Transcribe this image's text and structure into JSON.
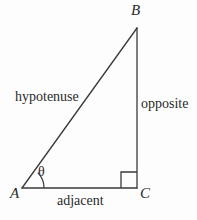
{
  "figure": {
    "type": "right-triangle-trigonometry-diagram",
    "background_color": "#fdfdfd",
    "stroke_color": "#3a3a3a",
    "text_color": "#2a2a2a",
    "vertices": {
      "A": {
        "label": "A",
        "x": 22,
        "y": 188
      },
      "B": {
        "label": "B",
        "x": 137,
        "y": 28
      },
      "C": {
        "label": "C",
        "x": 137,
        "y": 188
      }
    },
    "sides": {
      "hypotenuse": {
        "label": "hypotenuse",
        "from": "A",
        "to": "B"
      },
      "opposite": {
        "label": "opposite",
        "from": "B",
        "to": "C"
      },
      "adjacent": {
        "label": "adjacent",
        "from": "A",
        "to": "C"
      }
    },
    "angle": {
      "label": "θ",
      "at_vertex": "A",
      "arc_radius": 22
    },
    "right_angle": {
      "at_vertex": "C",
      "marker_size": 16
    }
  }
}
